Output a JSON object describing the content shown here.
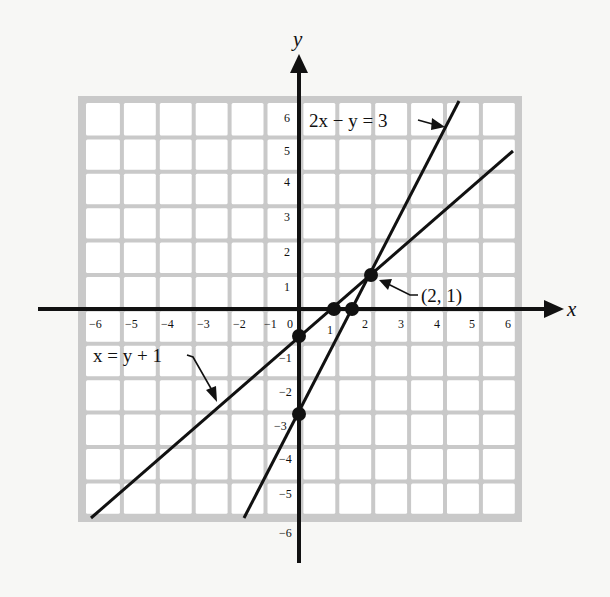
{
  "chart_data": {
    "type": "line",
    "title": "",
    "xlabel": "x",
    "ylabel": "y",
    "xlim": [
      -6,
      6
    ],
    "ylim": [
      -6,
      6
    ],
    "grid": true,
    "x_ticks": [
      "-6",
      "-5",
      "-4",
      "-3",
      "-2",
      "-1",
      "0",
      "1",
      "2",
      "3",
      "4",
      "5",
      "6"
    ],
    "y_ticks": [
      "6",
      "5",
      "4",
      "3",
      "2",
      "1",
      "-1",
      "-2",
      "-3",
      "-4",
      "-5",
      "-6"
    ],
    "series": [
      {
        "name": "2x − y = 3",
        "equation": "2x - y = 3",
        "slope": 2,
        "intercept": -3,
        "x": [
          -1.5,
          4.5
        ],
        "y": [
          -6,
          6
        ]
      },
      {
        "name": "x = y + 1",
        "equation": "x = y + 1",
        "slope": 1,
        "intercept": -1,
        "x": [
          -5.8,
          6
        ],
        "y": [
          -6.8,
          5
        ]
      }
    ],
    "points": [
      {
        "x": 0,
        "y": -1,
        "note": "y-intercept of x = y + 1"
      },
      {
        "x": 0,
        "y": -3,
        "note": "y-intercept of 2x − y = 3"
      },
      {
        "x": 1,
        "y": 0,
        "note": "x-intercept of x = y + 1"
      },
      {
        "x": 1.5,
        "y": 0,
        "note": "x-intercept of 2x − y = 3"
      },
      {
        "x": 2,
        "y": 1,
        "note": "intersection"
      }
    ],
    "annotations": [
      {
        "text": "2x − y = 3",
        "target": "2x − y = 3"
      },
      {
        "text": "x = y + 1",
        "target": "x = y + 1"
      },
      {
        "text": "(2, 1)",
        "target": "intersection"
      }
    ]
  },
  "labels": {
    "x_axis": "x",
    "y_axis": "y",
    "line1_label": "2x − y = 3",
    "line2_label": "x = y + 1",
    "intersection_label": "(2, 1)",
    "x_ticks": {
      "n6": "−6",
      "n5": "−5",
      "n4": "−4",
      "n3": "−3",
      "n2": "−2",
      "n1": "−1",
      "zero": "0",
      "p1": "1",
      "p2": "2",
      "p3": "3",
      "p4": "4",
      "p5": "5",
      "p6": "6"
    },
    "y_ticks": {
      "p6": "6",
      "p5": "5",
      "p4": "4",
      "p3": "3",
      "p2": "2",
      "p1": "1",
      "n1": "−1",
      "n2": "−2",
      "n3": "−3",
      "n4": "−4",
      "n5": "−5",
      "n6": "−6"
    }
  },
  "colors": {
    "grid": "#c9c9c9",
    "cell": "#ffffff",
    "ink": "#111111",
    "background": "#f7f7f5"
  }
}
